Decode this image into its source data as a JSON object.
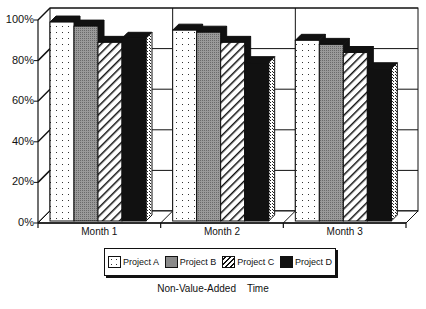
{
  "chart_data": {
    "type": "bar",
    "style": "3d-clustered",
    "title": "Non-Value-Added    Time",
    "xlabel": "",
    "ylabel": "",
    "categories": [
      "Month 1",
      "Month 2",
      "Month 3"
    ],
    "series": [
      {
        "name": "Project A",
        "pattern": "dots",
        "values": [
          98,
          94,
          89
        ]
      },
      {
        "name": "Project B",
        "pattern": "gray",
        "values": [
          96,
          93,
          87
        ]
      },
      {
        "name": "Project C",
        "pattern": "hatch",
        "values": [
          88,
          88,
          83
        ]
      },
      {
        "name": "Project D",
        "pattern": "black",
        "values": [
          90,
          78,
          75
        ]
      }
    ],
    "ylim": [
      0,
      100
    ],
    "yticks": [
      "0%",
      "20%",
      "40%",
      "60%",
      "80%",
      "100%"
    ],
    "grid": true,
    "legend_position": "bottom"
  },
  "legend": {
    "items": [
      "Project A",
      "Project B",
      "Project C",
      "Project D"
    ]
  },
  "title": "Non-Value-Added    Time",
  "colors": {
    "frame": "#111111",
    "gray": "#8a8a8a",
    "black": "#111111",
    "white": "#ffffff"
  }
}
